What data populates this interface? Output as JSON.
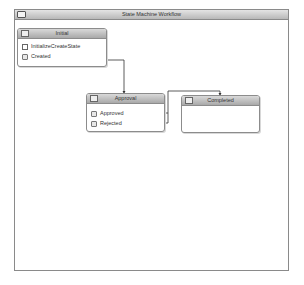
{
  "window": {
    "title": "State Machine Workflow",
    "icon": "window-icon"
  },
  "states": [
    {
      "name": "Initial",
      "icon": "state-icon",
      "activities": [
        {
          "label": "InitializeCreateState",
          "icon": "state-initialization-icon"
        },
        {
          "label": "Created",
          "icon": "event-driven-icon"
        }
      ]
    },
    {
      "name": "Approval",
      "icon": "state-icon",
      "activities": [
        {
          "label": "Approved",
          "icon": "event-driven-icon"
        },
        {
          "label": "Rejected",
          "icon": "event-driven-icon"
        }
      ]
    },
    {
      "name": "Completed",
      "icon": "state-icon",
      "activities": []
    }
  ],
  "transitions": [
    {
      "from": "Initial.Created",
      "to": "Approval"
    },
    {
      "from": "Approval.Approved",
      "to": "Completed"
    },
    {
      "from": "Approval.Rejected",
      "to": "Completed"
    }
  ],
  "colors": {
    "border": "#8c8c8c",
    "header_top": "#d9d9d9",
    "header_bottom": "#a9a9a9",
    "connector": "#333333"
  }
}
